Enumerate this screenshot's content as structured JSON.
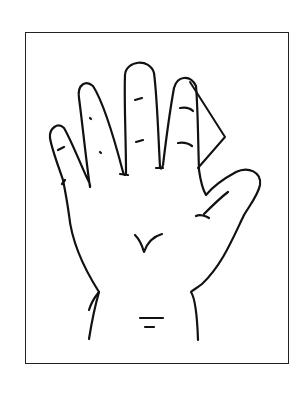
{
  "figure": {
    "stroke_color": "#111111",
    "background": "#ffffff",
    "marker": "triangle-beside-ring-finger"
  }
}
